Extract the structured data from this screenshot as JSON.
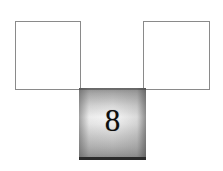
{
  "figure": {
    "background_color": "#ffffff",
    "width": 223,
    "height": 171
  },
  "shapes": {
    "left_square": {
      "label": "",
      "kind": "square",
      "fill": "#ffffff",
      "border_color": "#8a8a8a",
      "x": 15,
      "y": 21,
      "width": 66,
      "height": 69
    },
    "right_square": {
      "label": "",
      "kind": "square",
      "fill": "#ffffff",
      "border_color": "#8a8a8a",
      "x": 143,
      "y": 21,
      "width": 67,
      "height": 69
    },
    "center_square": {
      "label": "8",
      "kind": "square",
      "fill": "gradient-gray",
      "gradient_top_color": "#8d8d8d",
      "gradient_mid_color": "#f6f6f6",
      "gradient_bottom_color": "#8e8e8e",
      "border_bottom_color": "#2b2b2b",
      "text_color": "#0d0d0d",
      "x": 79,
      "y": 88,
      "width": 67,
      "height": 72
    }
  }
}
